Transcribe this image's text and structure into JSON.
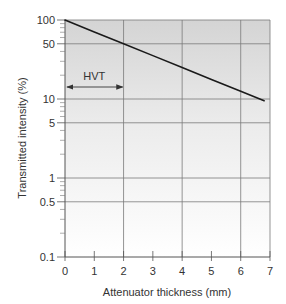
{
  "chart_data": {
    "type": "line",
    "title": "",
    "xlabel": "Attenuator thickness (mm)",
    "ylabel": "Transmitted intensity (%)",
    "xlim": [
      0,
      7
    ],
    "ylim": [
      0.1,
      100
    ],
    "yscale": "log",
    "x_ticks": [
      0,
      1,
      2,
      3,
      4,
      5,
      6,
      7
    ],
    "x_tick_labels": [
      "0",
      "1",
      "2",
      "3",
      "4",
      "5",
      "6",
      "7"
    ],
    "x_gridlines": [
      2,
      4,
      6
    ],
    "y_ticks": [
      100,
      50,
      10,
      5,
      1,
      0.5,
      0.1
    ],
    "y_tick_labels": [
      "100",
      "50",
      "10",
      "5",
      "1",
      "0.5",
      "0.1"
    ],
    "y_gridlines": [
      50,
      10,
      5,
      1,
      0.5
    ],
    "y_minor_ticks": [
      90,
      80,
      70,
      60,
      40,
      30,
      20,
      9,
      8,
      7,
      6,
      4,
      3,
      2,
      0.9,
      0.8,
      0.7,
      0.6,
      0.4,
      0.3,
      0.2
    ],
    "grid": true,
    "legend": null,
    "series": [
      {
        "name": "Transmitted intensity",
        "color": "#1a1a1a",
        "x": [
          0,
          1,
          2,
          3,
          4,
          5,
          6,
          6.8
        ],
        "y": [
          100,
          70.7,
          50,
          35.4,
          25,
          17.7,
          12.5,
          9.5
        ]
      }
    ],
    "annotations": [
      {
        "text": "HVT",
        "type": "double-arrow",
        "x_start": 0,
        "x_end": 2,
        "y": 15
      }
    ],
    "background": {
      "type": "vertical-gradient",
      "top_color": "#d4d4d4",
      "bottom_color": "#ffffff"
    }
  }
}
